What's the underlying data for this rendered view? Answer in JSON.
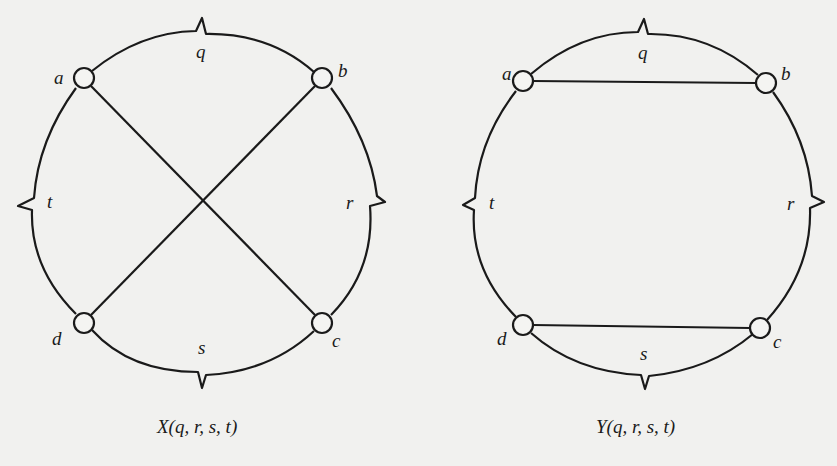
{
  "diagrams": [
    {
      "id": "X",
      "caption": "X(q, r, s, t)",
      "nodes": {
        "a": "a",
        "b": "b",
        "c": "c",
        "d": "d"
      },
      "arcs": {
        "q": "q",
        "r": "r",
        "s": "s",
        "t": "t"
      },
      "chords": [
        "a-c",
        "b-d"
      ]
    },
    {
      "id": "Y",
      "caption": "Y(q, r, s, t)",
      "nodes": {
        "a": "a",
        "b": "b",
        "c": "c",
        "d": "d"
      },
      "arcs": {
        "q": "q",
        "r": "r",
        "s": "s",
        "t": "t"
      },
      "chords": [
        "a-b",
        "d-c"
      ]
    }
  ]
}
